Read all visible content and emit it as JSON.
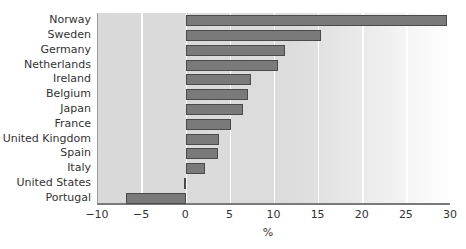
{
  "chart_data": {
    "type": "bar",
    "orientation": "horizontal",
    "title": "",
    "xlabel": "%",
    "ylabel": "",
    "xlim": [
      -10,
      30
    ],
    "xticks": [
      -10,
      -5,
      0,
      5,
      10,
      15,
      20,
      25,
      30
    ],
    "xtick_labels": [
      "−10",
      "−5",
      "0",
      "5",
      "10",
      "15",
      "20",
      "25",
      "30"
    ],
    "grid": "vertical white gridlines at each x tick",
    "legend": null,
    "categories": [
      "Norway",
      "Sweden",
      "Germany",
      "Netherlands",
      "Ireland",
      "Belgium",
      "Japan",
      "France",
      "United Kingdom",
      "Spain",
      "Italy",
      "United States",
      "Portugal"
    ],
    "values": [
      29.6,
      15.3,
      11.2,
      10.4,
      7.3,
      7.0,
      6.4,
      5.1,
      3.7,
      3.6,
      2.1,
      -0.3,
      -6.8
    ]
  },
  "colors": {
    "bar_fill": "#7a7a7a",
    "bar_edge": "#4a4a4a",
    "plot_background": "#d9d9d9",
    "gridline": "#ffffff"
  }
}
